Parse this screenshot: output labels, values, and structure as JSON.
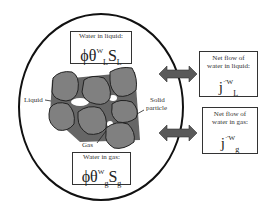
{
  "diagram": {
    "colors": {
      "particle": "#808080",
      "arrow": "#5a5a5a",
      "outline": "#111111",
      "background": "#ffffff"
    },
    "top_box": {
      "caption": "Water in liquid:",
      "phi": "ϕ",
      "theta": "θ",
      "theta_sub": "L",
      "theta_sup": "W",
      "S": "S",
      "S_sub": "L"
    },
    "bottom_box": {
      "caption": "Water in gas:",
      "phi": "ϕ",
      "theta": "θ",
      "theta_sub": "g",
      "theta_sup": "W",
      "S": "S",
      "S_sub": "g"
    },
    "right_top_box": {
      "caption_line1": "Net flow of",
      "caption_line2": "water in liquid:",
      "symbol": "j",
      "sup": "·'W",
      "sub": "L"
    },
    "right_bottom_box": {
      "caption_line1": "Net flow of",
      "caption_line2": "water in gas:",
      "symbol": "j",
      "sup": "·'W",
      "sub": "g"
    },
    "labels": {
      "liquid": "Liquid",
      "solid_line1": "Solid",
      "solid_line2": "particle",
      "gas": "Gas"
    }
  }
}
